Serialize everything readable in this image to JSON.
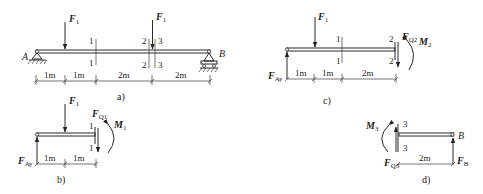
{
  "figure_a": {
    "caption": "a)",
    "support_left": "A",
    "support_right": "B",
    "force1": {
      "name": "F",
      "sub": "1"
    },
    "force2": {
      "name": "F",
      "sub": "1"
    },
    "sections": {
      "s1_top": "1",
      "s1_bot": "1",
      "s2_top": "2",
      "s2_bot": "2",
      "s3_top": "3",
      "s3_bot": "3"
    },
    "dims": [
      "1m",
      "1m",
      "2m",
      "2m"
    ]
  },
  "figure_b": {
    "caption": "b)",
    "force": {
      "name": "F",
      "sub": "1"
    },
    "reaction": {
      "name": "F",
      "sub": "Ay"
    },
    "shear": {
      "name": "F",
      "sub": "Q1"
    },
    "moment": {
      "name": "M",
      "sub": "1"
    },
    "sections": {
      "top": "1",
      "bot": "1"
    },
    "dims": [
      "1m",
      "1m"
    ]
  },
  "figure_c": {
    "caption": "c)",
    "force": {
      "name": "F",
      "sub": "1"
    },
    "reaction": {
      "name": "F",
      "sub": "Ay"
    },
    "shear": {
      "name": "F",
      "sub": "Q2"
    },
    "moment": {
      "name": "M",
      "sub": "2"
    },
    "sections": {
      "s1_top": "1",
      "s1_bot": "1",
      "s2_top": "2",
      "s2_bot": "2"
    },
    "dims": [
      "1m",
      "1m",
      "2m"
    ]
  },
  "figure_d": {
    "caption": "d)",
    "support": "B",
    "reaction": {
      "name": "F",
      "sub": "B"
    },
    "shear": {
      "name": "F",
      "sub": "Q3"
    },
    "moment": {
      "name": "M",
      "sub": "3"
    },
    "sections": {
      "top": "3",
      "bot": "3"
    },
    "dims": [
      "2m"
    ]
  }
}
